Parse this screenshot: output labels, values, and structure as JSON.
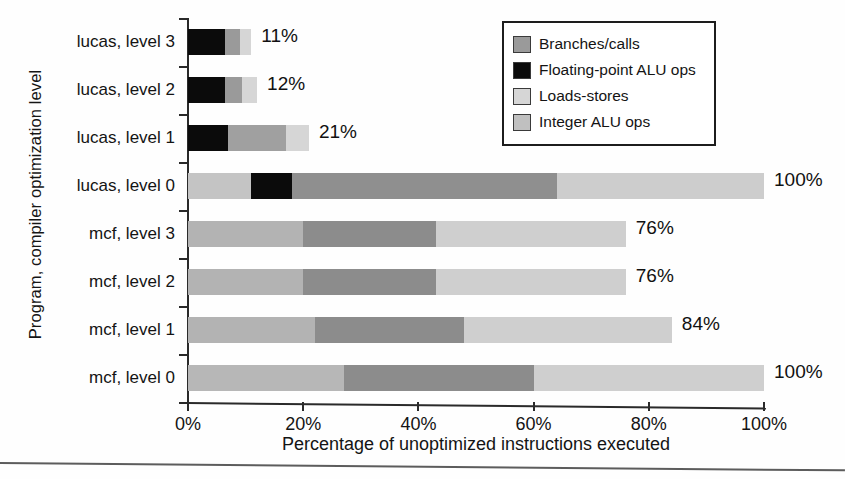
{
  "chart_data": {
    "type": "bar",
    "orientation": "horizontal",
    "stacked": true,
    "title": "",
    "xlabel": "Percentage of unoptimized instructions executed",
    "ylabel": "Program, compiler optimization level",
    "xlim": [
      0,
      100
    ],
    "xticks": [
      "0%",
      "20%",
      "40%",
      "60%",
      "80%",
      "100%"
    ],
    "xtick_values": [
      0,
      20,
      40,
      60,
      80,
      100
    ],
    "grid": false,
    "legend_position": "top-right",
    "legend": [
      {
        "label": "Branches/calls",
        "color": "#9a9a9a"
      },
      {
        "label": "Floating-point ALU ops",
        "color": "#0b0b0b"
      },
      {
        "label": "Loads-stores",
        "color": "#d2d2d2"
      },
      {
        "label": "Integer ALU ops",
        "color": "#bdbdbd"
      }
    ],
    "categories": [
      "lucas, level 3",
      "lucas, level 2",
      "lucas, level 1",
      "lucas, level 0",
      "mcf, level 3",
      "mcf, level 2",
      "mcf, level 1",
      "mcf, level 0"
    ],
    "totals": [
      11,
      12,
      21,
      100,
      76,
      76,
      84,
      100
    ],
    "total_labels": [
      "11%",
      "12%",
      "21%",
      "100%",
      "76%",
      "76%",
      "84%",
      "100%"
    ],
    "bars": [
      {
        "category": "lucas, level 3",
        "total": 11,
        "label": "11%",
        "segments": [
          {
            "series": "Floating-point ALU ops",
            "value": 6.5,
            "color": "#0b0b0b"
          },
          {
            "series": "Branches/calls",
            "value": 2.5,
            "color": "#9a9a9a"
          },
          {
            "series": "Loads-stores",
            "value": 2.0,
            "color": "#d6d6d6"
          }
        ]
      },
      {
        "category": "lucas, level 2",
        "total": 12,
        "label": "12%",
        "segments": [
          {
            "series": "Floating-point ALU ops",
            "value": 6.5,
            "color": "#0b0b0b"
          },
          {
            "series": "Branches/calls",
            "value": 2.8,
            "color": "#9a9a9a"
          },
          {
            "series": "Loads-stores",
            "value": 2.7,
            "color": "#d6d6d6"
          }
        ]
      },
      {
        "category": "lucas, level 1",
        "total": 21,
        "label": "21%",
        "segments": [
          {
            "series": "Floating-point ALU ops",
            "value": 7.0,
            "color": "#0b0b0b"
          },
          {
            "series": "Branches/calls",
            "value": 10.0,
            "color": "#a0a0a0"
          },
          {
            "series": "Loads-stores",
            "value": 4.0,
            "color": "#d6d6d6"
          }
        ]
      },
      {
        "category": "lucas, level 0",
        "total": 100,
        "label": "100%",
        "segments": [
          {
            "series": "Integer ALU ops",
            "value": 11.0,
            "color": "#c4c4c4"
          },
          {
            "series": "Floating-point ALU ops",
            "value": 7.0,
            "color": "#0b0b0b"
          },
          {
            "series": "Branches/calls",
            "value": 46.0,
            "color": "#8f8f8f"
          },
          {
            "series": "Loads-stores",
            "value": 36.0,
            "color": "#cdcdcd"
          }
        ]
      },
      {
        "category": "mcf, level 3",
        "total": 76,
        "label": "76%",
        "segments": [
          {
            "series": "Integer ALU ops",
            "value": 20.0,
            "color": "#b3b3b3"
          },
          {
            "series": "Branches/calls",
            "value": 23.0,
            "color": "#8c8c8c"
          },
          {
            "series": "Loads-stores",
            "value": 33.0,
            "color": "#cfcfcf"
          }
        ]
      },
      {
        "category": "mcf, level 2",
        "total": 76,
        "label": "76%",
        "segments": [
          {
            "series": "Integer ALU ops",
            "value": 20.0,
            "color": "#b3b3b3"
          },
          {
            "series": "Branches/calls",
            "value": 23.0,
            "color": "#8c8c8c"
          },
          {
            "series": "Loads-stores",
            "value": 33.0,
            "color": "#cfcfcf"
          }
        ]
      },
      {
        "category": "mcf, level 1",
        "total": 84,
        "label": "84%",
        "segments": [
          {
            "series": "Integer ALU ops",
            "value": 22.0,
            "color": "#b3b3b3"
          },
          {
            "series": "Branches/calls",
            "value": 26.0,
            "color": "#8c8c8c"
          },
          {
            "series": "Loads-stores",
            "value": 36.0,
            "color": "#cfcfcf"
          }
        ]
      },
      {
        "category": "mcf, level 0",
        "total": 100,
        "label": "100%",
        "segments": [
          {
            "series": "Integer ALU ops",
            "value": 27.0,
            "color": "#b7b7b7"
          },
          {
            "series": "Branches/calls",
            "value": 33.0,
            "color": "#8c8c8c"
          },
          {
            "series": "Loads-stores",
            "value": 40.0,
            "color": "#cfcfcf"
          }
        ]
      }
    ]
  },
  "axes": {
    "x_title": "Percentage of unoptimized instructions executed",
    "y_title": "Program, compiler optimization level"
  },
  "legend": {
    "items": [
      {
        "label": "Branches/calls",
        "swatch": "#9a9a9a"
      },
      {
        "label": "Floating-point ALU ops",
        "swatch": "#0b0b0b"
      },
      {
        "label": "Loads-stores",
        "swatch": "#d6d6d6"
      },
      {
        "label": "Integer ALU ops",
        "swatch": "#c0c0c0"
      }
    ]
  }
}
